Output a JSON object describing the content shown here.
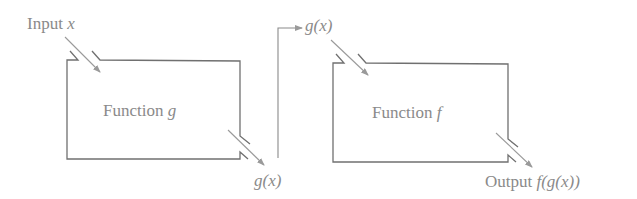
{
  "diagram": {
    "type": "function-composition",
    "input_label": {
      "prefix": "Input ",
      "var": "x"
    },
    "box_g": {
      "prefix": "Function ",
      "var": "g"
    },
    "intermediate_out": {
      "text": "g(x)"
    },
    "intermediate_in": {
      "text": "g(x)"
    },
    "box_f": {
      "prefix": "Function ",
      "var": "f"
    },
    "output_label": {
      "prefix": "Output ",
      "var": "f(g(x))"
    },
    "colors": {
      "stroke": "#707070",
      "arrow": "#9a9a9a",
      "text": "#8a8a8a"
    }
  }
}
